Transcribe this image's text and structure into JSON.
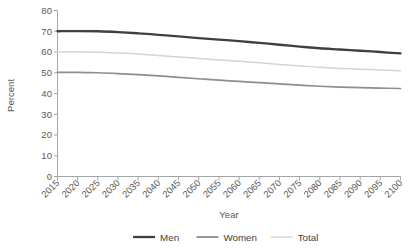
{
  "chart_data": {
    "type": "line",
    "title": "",
    "xlabel": "Year",
    "ylabel": "Percent",
    "xlim": [
      2015,
      2100
    ],
    "ylim": [
      0,
      80
    ],
    "grid": false,
    "legend_position": "bottom",
    "x": [
      2015,
      2020,
      2025,
      2030,
      2035,
      2040,
      2045,
      2050,
      2055,
      2060,
      2065,
      2070,
      2075,
      2080,
      2085,
      2090,
      2095,
      2100
    ],
    "xtick_labels": [
      "2015",
      "2020",
      "2025",
      "2030",
      "2035",
      "2040",
      "2045",
      "2050",
      "2055",
      "2060",
      "2065",
      "2070",
      "2075",
      "2080",
      "2085",
      "2090",
      "2095",
      "2100"
    ],
    "ytick_labels": [
      "0",
      "10",
      "20",
      "30",
      "40",
      "50",
      "60",
      "70",
      "80"
    ],
    "yticks": [
      0,
      10,
      20,
      30,
      40,
      50,
      60,
      70,
      80
    ],
    "series": [
      {
        "name": "Men",
        "color": "#3f4042",
        "values": [
          70.0,
          70.1,
          70.0,
          69.6,
          69.0,
          68.3,
          67.5,
          66.7,
          66.0,
          65.2,
          64.4,
          63.5,
          62.6,
          61.8,
          61.2,
          60.6,
          60.0,
          59.3
        ]
      },
      {
        "name": "Women",
        "color": "#8d8e90",
        "values": [
          50.2,
          50.2,
          50.0,
          49.6,
          49.1,
          48.5,
          47.8,
          47.1,
          46.4,
          45.8,
          45.2,
          44.6,
          44.0,
          43.5,
          43.1,
          42.8,
          42.6,
          42.4
        ]
      },
      {
        "name": "Total",
        "color": "#d3d4d5",
        "values": [
          60.0,
          60.1,
          59.9,
          59.5,
          59.0,
          58.3,
          57.6,
          56.9,
          56.2,
          55.5,
          54.8,
          54.0,
          53.3,
          52.6,
          52.1,
          51.7,
          51.3,
          51.0
        ]
      }
    ]
  },
  "legend": {
    "items": [
      {
        "label": "Men",
        "color": "#3f4042",
        "thickness": 2.3
      },
      {
        "label": "Women",
        "color": "#8d8e90",
        "thickness": 1.8
      },
      {
        "label": "Total",
        "color": "#d3d4d5",
        "thickness": 1.4
      }
    ]
  },
  "axes": {
    "y_axis_title": "Percent",
    "x_axis_title": "Year"
  }
}
